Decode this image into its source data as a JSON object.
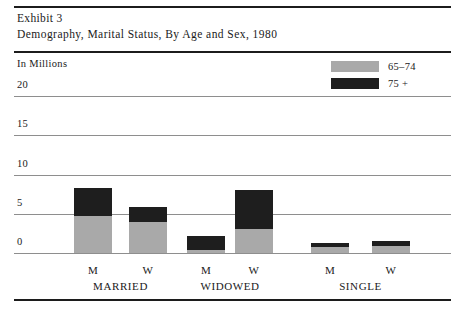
{
  "exhibit": {
    "number_line": "Exhibit 3",
    "title_line": "Demography, Marital Status, By Age and Sex, 1980"
  },
  "axis": {
    "unit_caption": "In Millions"
  },
  "legend": {
    "items": [
      {
        "label": "65–74",
        "color": "#a9a9a9",
        "swatch_name": "legend-swatch-65-74"
      },
      {
        "label": "75 +",
        "color": "#1e1e1e",
        "swatch_name": "legend-swatch-75-plus"
      }
    ]
  },
  "chart_data": {
    "type": "bar",
    "subtype": "stacked-vertical-grouped",
    "title": "Demography, Marital Status, By Age and Sex, 1980",
    "subtitle": "Exhibit 3",
    "xlabel": "",
    "ylabel": "In Millions",
    "ylim": [
      0,
      20
    ],
    "yticks": [
      0,
      5,
      10,
      15,
      20
    ],
    "ytick_labels": [
      "0",
      "5",
      "10",
      "15",
      "20"
    ],
    "grid": true,
    "grid_axis": "y",
    "legend_position": "top-right",
    "categories": [
      "MARRIED – M",
      "MARRIED – W",
      "WIDOWED – M",
      "WIDOWED – W",
      "SINGLE – M",
      "SINGLE – W"
    ],
    "groups": [
      {
        "name": "MARRIED",
        "sexes": [
          "M",
          "W"
        ]
      },
      {
        "name": "WIDOWED",
        "sexes": [
          "M",
          "W"
        ]
      },
      {
        "name": "SINGLE",
        "sexes": [
          "M",
          "W"
        ]
      }
    ],
    "series": [
      {
        "name": "65–74",
        "color": "#a9a9a9",
        "values": [
          4.7,
          4.0,
          0.4,
          3.1,
          0.8,
          0.9
        ]
      },
      {
        "name": "75 +",
        "color": "#1e1e1e",
        "values": [
          3.6,
          1.8,
          1.8,
          4.9,
          0.5,
          0.6
        ]
      }
    ],
    "totals": [
      8.3,
      5.8,
      2.2,
      8.0,
      1.3,
      1.5
    ],
    "bars": [
      {
        "group": "MARRIED",
        "sex": "M",
        "young": 4.7,
        "old": 3.6,
        "total": 8.3
      },
      {
        "group": "MARRIED",
        "sex": "W",
        "young": 4.0,
        "old": 1.8,
        "total": 5.8
      },
      {
        "group": "WIDOWED",
        "sex": "M",
        "young": 0.4,
        "old": 1.8,
        "total": 2.2
      },
      {
        "group": "WIDOWED",
        "sex": "W",
        "young": 3.1,
        "old": 4.9,
        "total": 8.0
      },
      {
        "group": "SINGLE",
        "sex": "M",
        "young": 0.8,
        "old": 0.5,
        "total": 1.3
      },
      {
        "group": "SINGLE",
        "sex": "W",
        "young": 0.9,
        "old": 0.6,
        "total": 1.5
      }
    ]
  },
  "colors": {
    "rule": "#1c1c1c",
    "gridline": "#8e8e8e",
    "young_band": "#a9a9a9",
    "old_band": "#1e1e1e",
    "text": "#1a1a1a",
    "background": "#ffffff"
  }
}
